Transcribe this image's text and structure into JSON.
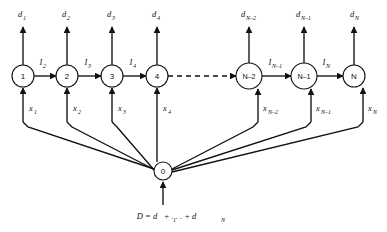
{
  "figure": {
    "title": "",
    "background_color": "#ffffff",
    "line_color": "#111111",
    "width": 387,
    "height": 232
  },
  "chain_nodes": [
    {
      "id": "n1",
      "label": "1",
      "cx": 23,
      "cy": 76,
      "r": 11,
      "demand_label": "d",
      "demand_sub": "1",
      "flow_label": "x",
      "flow_sub": "1"
    },
    {
      "id": "n2",
      "label": "2",
      "cx": 67,
      "cy": 76,
      "r": 11,
      "demand_label": "d",
      "demand_sub": "2",
      "flow_label": "x",
      "flow_sub": "2"
    },
    {
      "id": "n3",
      "label": "3",
      "cx": 112,
      "cy": 76,
      "r": 11,
      "demand_label": "d",
      "demand_sub": "3",
      "flow_label": "x",
      "flow_sub": "3"
    },
    {
      "id": "n4",
      "label": "4",
      "cx": 157,
      "cy": 76,
      "r": 11,
      "demand_label": "d",
      "demand_sub": "4",
      "flow_label": "x",
      "flow_sub": "4"
    },
    {
      "id": "nm2",
      "label": "N–2",
      "cx": 249,
      "cy": 76,
      "r": 13,
      "demand_label": "d",
      "demand_sub": "N–2",
      "flow_label": "x",
      "flow_sub": "N–2"
    },
    {
      "id": "nm1",
      "label": "N–1",
      "cx": 304,
      "cy": 76,
      "r": 13,
      "demand_label": "d",
      "demand_sub": "N–1",
      "flow_label": "x",
      "flow_sub": "N–1"
    },
    {
      "id": "nN",
      "label": "N",
      "cx": 354,
      "cy": 76,
      "r": 11,
      "demand_label": "d",
      "demand_sub": "N",
      "flow_label": "x",
      "flow_sub": "N"
    }
  ],
  "source_node": {
    "id": "n0",
    "label": "0",
    "cx": 163,
    "cy": 171,
    "r": 9
  },
  "chain_arcs": [
    {
      "from": "n1",
      "to": "n2",
      "label": "I",
      "sub": "2",
      "style": "solid"
    },
    {
      "from": "n2",
      "to": "n3",
      "label": "I",
      "sub": "3",
      "style": "solid"
    },
    {
      "from": "n3",
      "to": "n4",
      "label": "I",
      "sub": "4",
      "style": "solid"
    },
    {
      "from": "n4",
      "to": "nm2",
      "label": "",
      "sub": "",
      "style": "dashed"
    },
    {
      "from": "nm2",
      "to": "nm1",
      "label": "I",
      "sub": "N–1",
      "style": "solid"
    },
    {
      "from": "nm1",
      "to": "nN",
      "label": "I",
      "sub": "N",
      "style": "solid"
    }
  ],
  "equation": {
    "text": "D = d",
    "sub1": "1",
    "mid": "+ . . . + d",
    "sub2": "N",
    "full": "D = d₁ + . . . + dₙ"
  },
  "legend_note": ""
}
